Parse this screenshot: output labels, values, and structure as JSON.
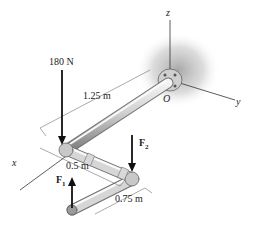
{
  "forces": {
    "load": {
      "label": "180 N"
    },
    "f1": {
      "label": "F",
      "sub": "1"
    },
    "f2": {
      "label": "F",
      "sub": "2"
    }
  },
  "dimensions": {
    "segment_1": "1.25 m",
    "segment_2": "0.5 m",
    "segment_3": "0.75 m"
  },
  "axes": {
    "x": "x",
    "y": "y",
    "z": "z",
    "origin": "O"
  },
  "colors": {
    "pipe_light": "#e8e8e8",
    "pipe_dark": "#8a8a8a",
    "line": "#333333",
    "shadow": "#bdbdbd"
  }
}
